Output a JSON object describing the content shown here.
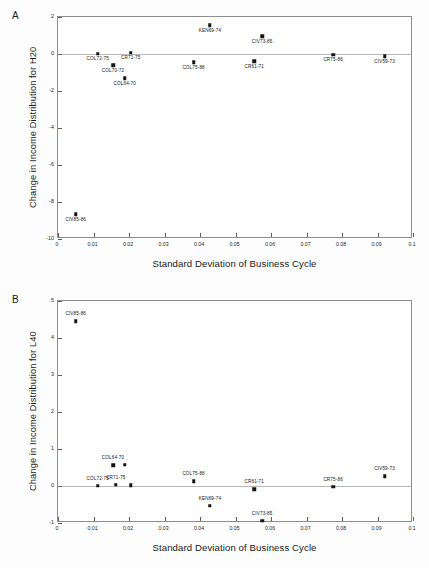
{
  "figure": {
    "background_color": "#fdfdfd",
    "marker_color": "#141414",
    "frame_color": "#8d8d8d",
    "zero_line_color": "#b9b9b9"
  },
  "panels": [
    {
      "letter": "A",
      "xlabel": "Standard Deviation of Business Cycle",
      "ylabel": "Change in Income Distribution for H20"
    },
    {
      "letter": "B",
      "xlabel": "Standard Deviation of Business Cycle",
      "ylabel": "Change in Income Distribution for L40"
    }
  ],
  "chart_data": [
    {
      "type": "scatter",
      "panel": "A",
      "title": "",
      "xlabel": "Standard Deviation of Business Cycle",
      "ylabel": "Change in Income Distribution for H20",
      "xlim": [
        0,
        0.1
      ],
      "ylim": [
        -10,
        2
      ],
      "xticks": [
        0,
        0.01,
        0.02,
        0.03,
        0.04,
        0.05,
        0.06,
        0.07,
        0.08,
        0.09,
        0.1
      ],
      "xticklabels": [
        "0",
        "0.01",
        "0.02",
        "0.03",
        "0.04",
        "0.05",
        "0.06",
        "0.07",
        "0.08",
        "0.09",
        "0.1"
      ],
      "yticks": [
        2,
        0,
        -2,
        -4,
        -6,
        -8,
        -10
      ],
      "yticklabels": [
        "2",
        "0",
        "-2",
        "-4",
        "-6",
        "-8",
        "-10"
      ],
      "grid": false,
      "legend": "none",
      "zero_reference_line": 0,
      "points": [
        {
          "label": "CIV85-86",
          "x": 0.005,
          "y": -8.67,
          "label_pos": "below"
        },
        {
          "label": "COL72-75",
          "x": 0.0112,
          "y": 0.02,
          "label_pos": "below"
        },
        {
          "label": "COL70-72",
          "x": 0.0155,
          "y": -0.62,
          "label_pos": "below"
        },
        {
          "label": "COL64-70",
          "x": 0.0188,
          "y": -1.3,
          "label_pos": "below"
        },
        {
          "label": "CR71-75",
          "x": 0.0205,
          "y": 0.07,
          "label_pos": "below"
        },
        {
          "label": "COL75-88",
          "x": 0.0382,
          "y": -0.45,
          "label_pos": "below"
        },
        {
          "label": "KEN69-74",
          "x": 0.0428,
          "y": 1.55,
          "label_pos": "below"
        },
        {
          "label": "CR61-71",
          "x": 0.0553,
          "y": -0.38,
          "label_pos": "below"
        },
        {
          "label": "CIV73-85",
          "x": 0.0575,
          "y": 0.95,
          "label_pos": "below"
        },
        {
          "label": "CR75-86",
          "x": 0.0775,
          "y": -0.03,
          "label_pos": "below"
        },
        {
          "label": "CIV59-73",
          "x": 0.092,
          "y": -0.13,
          "label_pos": "below"
        }
      ]
    },
    {
      "type": "scatter",
      "panel": "B",
      "title": "",
      "xlabel": "Standard Deviation of Business Cycle",
      "ylabel": "Change in Income Distribution for L40",
      "xlim": [
        0,
        0.1
      ],
      "ylim": [
        -1,
        5
      ],
      "xticks": [
        0,
        0.01,
        0.02,
        0.03,
        0.04,
        0.05,
        0.06,
        0.07,
        0.08,
        0.09,
        0.1
      ],
      "xticklabels": [
        "0",
        "0.01",
        "0.02",
        "0.03",
        "0.04",
        "0.05",
        "0.06",
        "0.07",
        "0.08",
        "0.09",
        "0.1"
      ],
      "yticks": [
        5,
        4,
        3,
        2,
        1,
        0,
        -1
      ],
      "yticklabels": [
        "5",
        "4",
        "3",
        "2",
        "1",
        "0",
        "-1"
      ],
      "grid": false,
      "legend": "none",
      "zero_reference_line": 0,
      "points": [
        {
          "label": "CIV85-86",
          "x": 0.005,
          "y": 4.45,
          "label_pos": "above"
        },
        {
          "label": "COL72-75",
          "x": 0.0112,
          "y": 0.01,
          "label_pos": "above"
        },
        {
          "label": "COL64-70",
          "x": 0.0155,
          "y": 0.56,
          "label_pos": "above"
        },
        {
          "label": "",
          "x": 0.0188,
          "y": 0.57,
          "label_pos": "none"
        },
        {
          "label": "CR71-75",
          "x": 0.0163,
          "y": 0.04,
          "label_pos": "above"
        },
        {
          "label": "",
          "x": 0.0205,
          "y": 0.02,
          "label_pos": "none"
        },
        {
          "label": "COL75-88",
          "x": 0.0382,
          "y": 0.13,
          "label_pos": "above"
        },
        {
          "label": "KEN69-74",
          "x": 0.0428,
          "y": -0.54,
          "label_pos": "above"
        },
        {
          "label": "CR61-71",
          "x": 0.0553,
          "y": -0.09,
          "label_pos": "above"
        },
        {
          "label": "CIV73-85",
          "x": 0.0575,
          "y": -0.94,
          "label_pos": "above"
        },
        {
          "label": "CR75-86",
          "x": 0.0775,
          "y": -0.02,
          "label_pos": "above"
        },
        {
          "label": "CIV59-73",
          "x": 0.092,
          "y": 0.26,
          "label_pos": "above"
        }
      ]
    }
  ]
}
